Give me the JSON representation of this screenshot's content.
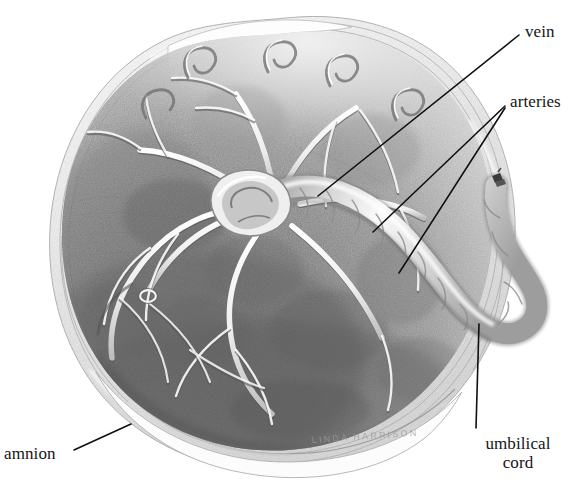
{
  "figure": {
    "name": "placenta-fetal-surface",
    "medium": "graphite pencil illustration",
    "signature": "LINDA HARRISON",
    "background_color": "#ffffff",
    "ink_color": "#101010"
  },
  "labels": {
    "vein": "vein",
    "arteries": "arteries",
    "umbilical_cord_line1": "umbilical",
    "umbilical_cord_line2": "cord",
    "amnion": "amnion"
  },
  "leaders": [
    {
      "name": "vein-leader",
      "from": [
        519,
        35
      ],
      "to": [
        318,
        196
      ]
    },
    {
      "name": "arteries-leader-upper",
      "from": [
        505,
        106
      ],
      "to": [
        373,
        232
      ]
    },
    {
      "name": "arteries-leader-lower",
      "from": [
        505,
        108
      ],
      "to": [
        399,
        273
      ]
    },
    {
      "name": "umbilical-cord-leader",
      "from": [
        476,
        428
      ],
      "to": [
        479,
        324
      ]
    },
    {
      "name": "amnion-leader",
      "from": [
        74,
        450
      ],
      "to": [
        131,
        424
      ]
    }
  ],
  "anatomy": {
    "organ": "placenta",
    "view": "fetal surface",
    "structures": [
      "chorionic vein",
      "chorionic arteries",
      "umbilical cord",
      "amnion membrane",
      "cord insertion"
    ],
    "cord_clamp_mark": true
  },
  "palette": {
    "disc_dark": "#6f6f6f",
    "disc_mid": "#9a9a9a",
    "disc_light": "#d7d7d7",
    "membrane": "#f2f2f2",
    "vessel_highlight": "#fbfbfb",
    "vessel_shadow": "#5c5c5c",
    "outline": "#8a8a8a"
  }
}
